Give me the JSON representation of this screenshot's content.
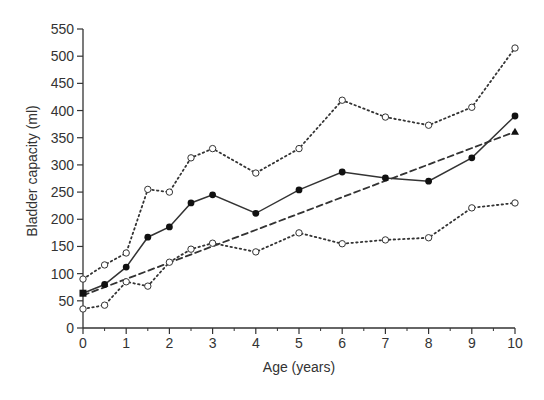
{
  "chart_data": {
    "type": "line",
    "title": "",
    "xlabel": "Age (years)",
    "ylabel": "Bladder capacity (ml)",
    "xlim": [
      0,
      10
    ],
    "ylim": [
      0,
      550
    ],
    "x_ticks": [
      0,
      1,
      2,
      3,
      4,
      5,
      6,
      7,
      8,
      9,
      10
    ],
    "x_minor_ticks": [
      0.5,
      1.5,
      2.5,
      3.5,
      4.5,
      5.5,
      6.5,
      7.5,
      8.5,
      9.5
    ],
    "y_ticks": [
      0,
      50,
      100,
      150,
      200,
      250,
      300,
      350,
      400,
      450,
      500,
      550
    ],
    "grid": false,
    "legend": null,
    "series": [
      {
        "name": "upper",
        "style": "dotted",
        "marker": "open-circle",
        "x": [
          0,
          0.5,
          1,
          1.5,
          2,
          2.5,
          3,
          4,
          5,
          6,
          7,
          8,
          9,
          10
        ],
        "values": [
          90,
          116,
          138,
          255,
          250,
          313,
          330,
          285,
          330,
          419,
          388,
          373,
          406,
          515
        ]
      },
      {
        "name": "mean",
        "style": "solid",
        "marker": "filled-circle",
        "x": [
          0,
          0.5,
          1,
          1.5,
          2,
          2.5,
          3,
          4,
          5,
          6,
          7,
          8,
          9,
          10
        ],
        "values": [
          64,
          80,
          112,
          167,
          186,
          230,
          245,
          211,
          254,
          287,
          276,
          270,
          313,
          390
        ]
      },
      {
        "name": "lower",
        "style": "dotted",
        "marker": "open-circle",
        "x": [
          0,
          0.5,
          1,
          1.5,
          2,
          2.5,
          3,
          4,
          5,
          6,
          7,
          8,
          9,
          10
        ],
        "values": [
          35,
          42,
          85,
          77,
          121,
          145,
          156,
          140,
          175,
          155,
          162,
          166,
          221,
          230
        ]
      },
      {
        "name": "linear",
        "style": "dashed",
        "marker": "filled-triangle-end",
        "x": [
          0,
          10
        ],
        "values": [
          60,
          361
        ]
      }
    ]
  }
}
